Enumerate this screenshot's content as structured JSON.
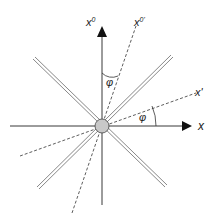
{
  "diagram": {
    "labels": {
      "time_axis": "x",
      "time_axis_sup": "0",
      "time_axis_prime": "x",
      "time_axis_prime_sup": "0'",
      "space_axis": "x",
      "space_axis_prime": "x'",
      "angle_time": "φ",
      "angle_space": "φ"
    },
    "colors": {
      "axis": "#222222",
      "origin_fill": "#c8c8c8",
      "origin_stroke": "#444444",
      "light_cone": "#555555",
      "dashed": "#333333"
    }
  }
}
